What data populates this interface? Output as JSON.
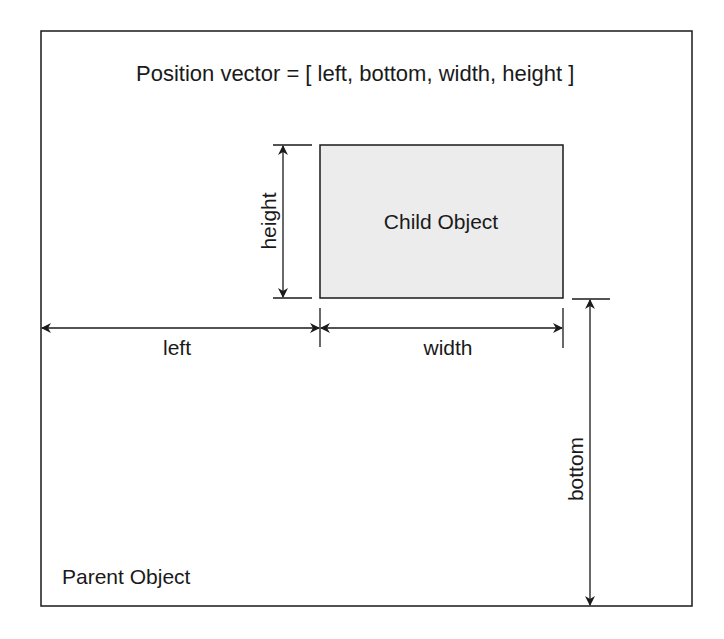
{
  "diagram": {
    "title": "Position vector = [ left, bottom, width, height ]",
    "parent_label": "Parent Object",
    "child_label": "Child Object",
    "dimension_labels": {
      "left": "left",
      "bottom": "bottom",
      "width": "width",
      "height": "height"
    },
    "colors": {
      "line": "#1a1a1a",
      "child_fill": "#ececec",
      "background": "#ffffff"
    }
  }
}
